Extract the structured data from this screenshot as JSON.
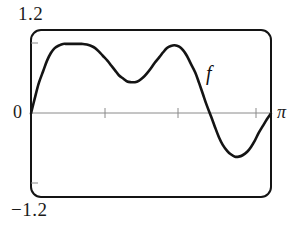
{
  "figure": {
    "kind": "function-graph",
    "frame": {
      "style": "rounded-rectangle-viewport",
      "stroke_color": "#141414",
      "stroke_width": 2,
      "corner_radius": 10,
      "left_px": 31,
      "top_px": 30,
      "right_px": 271,
      "bottom_px": 197
    },
    "labels": {
      "y_max": "1.2",
      "y_min": "−1.2",
      "origin": "0",
      "x_max": "π",
      "curve": "f"
    },
    "axis": {
      "color": "#8a8a8a",
      "width": 1,
      "y_px": 113,
      "tick_color": "#8a8a8a",
      "x_ticks_px": [
        105,
        178,
        256
      ],
      "y_ticks_px": [
        43,
        183
      ]
    },
    "curve": {
      "color": "#141414",
      "width": 2.6
    }
  },
  "chart_data": {
    "type": "line",
    "title": "",
    "xlabel": "",
    "ylabel": "",
    "xlim": [
      0,
      3.14159
    ],
    "ylim": [
      -1.2,
      1.2
    ],
    "xtick_labels": [
      "0",
      "π"
    ],
    "ytick_labels": [
      "1.2",
      "-1.2"
    ],
    "grid": false,
    "legend": "none",
    "annotations": [
      {
        "text": "f",
        "x": 2.35,
        "y": 0.52,
        "style": "italic",
        "role": "curve-label"
      }
    ],
    "series": [
      {
        "name": "f",
        "color": "#141414",
        "x": [
          0.0,
          0.05,
          0.1,
          0.16,
          0.21,
          0.26,
          0.31,
          0.37,
          0.42,
          0.47,
          0.52,
          0.58,
          0.63,
          0.68,
          0.73,
          0.79,
          0.84,
          0.89,
          0.94,
          1.0,
          1.05,
          1.1,
          1.15,
          1.21,
          1.26,
          1.31,
          1.36,
          1.41,
          1.47,
          1.52,
          1.57,
          1.62,
          1.68,
          1.73,
          1.78,
          1.83,
          1.88,
          1.94,
          1.99,
          2.04,
          2.09,
          2.15,
          2.2,
          2.25,
          2.3,
          2.36,
          2.41,
          2.46,
          2.51,
          2.57,
          2.62,
          2.67,
          2.72,
          2.77,
          2.83,
          2.88,
          2.93,
          2.98,
          3.04,
          3.09,
          3.14
        ],
        "y": [
          0.0,
          0.22,
          0.43,
          0.61,
          0.76,
          0.87,
          0.94,
          0.98,
          1.0,
          1.0,
          1.0,
          1.0,
          1.0,
          1.0,
          0.99,
          0.97,
          0.94,
          0.89,
          0.83,
          0.76,
          0.69,
          0.62,
          0.55,
          0.5,
          0.46,
          0.45,
          0.45,
          0.47,
          0.52,
          0.58,
          0.65,
          0.73,
          0.81,
          0.88,
          0.94,
          0.97,
          0.98,
          0.96,
          0.91,
          0.83,
          0.72,
          0.59,
          0.44,
          0.28,
          0.12,
          -0.05,
          -0.2,
          -0.34,
          -0.45,
          -0.54,
          -0.59,
          -0.62,
          -0.62,
          -0.6,
          -0.55,
          -0.48,
          -0.39,
          -0.28,
          -0.17,
          -0.08,
          0.0
        ]
      }
    ]
  }
}
